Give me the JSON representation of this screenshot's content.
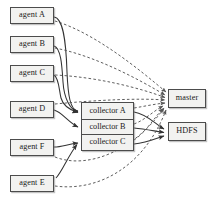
{
  "diagram": {
    "colors": {
      "node_fill": "#f2f2f0",
      "node_border": "#4c4c4c",
      "solid_edge": "#333333",
      "dashed_edge": "#555555",
      "background": "#ffffff",
      "text": "#1a1a1a"
    },
    "agents": [
      {
        "id": "agent-a",
        "label": "agent A",
        "x": 10,
        "y": 7,
        "w": 44,
        "h": 17
      },
      {
        "id": "agent-b",
        "label": "agent B",
        "x": 10,
        "y": 36,
        "w": 44,
        "h": 17
      },
      {
        "id": "agent-c",
        "label": "agent C",
        "x": 10,
        "y": 65,
        "w": 44,
        "h": 17
      },
      {
        "id": "agent-d",
        "label": "agent D",
        "x": 10,
        "y": 101,
        "w": 44,
        "h": 17
      },
      {
        "id": "agent-f",
        "label": "agent F",
        "x": 10,
        "y": 139,
        "w": 44,
        "h": 17
      },
      {
        "id": "agent-e",
        "label": "agent E",
        "x": 10,
        "y": 175,
        "w": 44,
        "h": 17
      }
    ],
    "collector_stack": {
      "x": 81,
      "y": 102,
      "w": 53,
      "h": 49,
      "cells": [
        {
          "id": "collector-a",
          "label": "collector A"
        },
        {
          "id": "collector-b",
          "label": "collector B"
        },
        {
          "id": "collector-c",
          "label": "collector C"
        }
      ]
    },
    "services": [
      {
        "id": "master",
        "label": "master",
        "x": 168,
        "y": 89,
        "w": 38,
        "h": 19
      },
      {
        "id": "hdfs",
        "label": "HDFS",
        "x": 168,
        "y": 122,
        "w": 38,
        "h": 19
      }
    ],
    "legend": {
      "solid_meaning": "data flow",
      "dashed_meaning": "control / heartbeat"
    },
    "edges": {
      "solid": [
        {
          "from": "agent-a",
          "to": "collector-a"
        },
        {
          "from": "agent-b",
          "to": "collector-a"
        },
        {
          "from": "agent-c",
          "to": "collector-a"
        },
        {
          "from": "agent-d",
          "to": "collector-b"
        },
        {
          "from": "agent-f",
          "to": "collector-c"
        },
        {
          "from": "agent-e",
          "to": "collector-c"
        },
        {
          "from": "collector-a",
          "to": "hdfs"
        },
        {
          "from": "collector-b",
          "to": "hdfs"
        },
        {
          "from": "collector-c",
          "to": "hdfs"
        }
      ],
      "dashed": [
        {
          "from": "agent-a",
          "to": "master"
        },
        {
          "from": "agent-b",
          "to": "master"
        },
        {
          "from": "agent-c",
          "to": "master"
        },
        {
          "from": "agent-d",
          "to": "master"
        },
        {
          "from": "agent-f",
          "to": "master"
        },
        {
          "from": "agent-e",
          "to": "master"
        },
        {
          "from": "collector-a",
          "to": "master"
        },
        {
          "from": "collector-b",
          "to": "master"
        },
        {
          "from": "collector-c",
          "to": "master"
        }
      ]
    }
  }
}
